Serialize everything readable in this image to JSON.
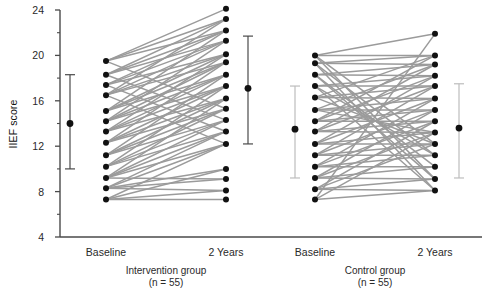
{
  "chart_data": {
    "type": "line",
    "title": "",
    "subtitle": "",
    "xlabel": "",
    "ylabel": "IIEF score",
    "ylim": [
      4,
      24
    ],
    "yticks": [
      4,
      8,
      12,
      16,
      20,
      24
    ],
    "ytick_labels": [
      "4",
      "8",
      "12",
      "16",
      "20",
      "24"
    ],
    "yminor_ticks": [
      6,
      10,
      14,
      18,
      22
    ],
    "grid": false,
    "legend": "none",
    "x_categories": [
      "Baseline",
      "2 Years",
      "Baseline",
      "2 Years"
    ],
    "groups": [
      {
        "name": "Intervention group",
        "n_label": "(n = 55)",
        "n": 55,
        "x_positions": [
          "Baseline",
          "2 Years"
        ],
        "error_bar_color": "#4a4a4a",
        "summary": [
          {
            "x": "Baseline",
            "mean": 14.0,
            "low": 10.0,
            "high": 18.3
          },
          {
            "x": "2 Years",
            "mean": 17.1,
            "low": 12.2,
            "high": 21.7
          }
        ],
        "pairs": [
          {
            "baseline": 19.5,
            "years2": 24.1
          },
          {
            "baseline": 19.5,
            "years2": 23.2
          },
          {
            "baseline": 18.3,
            "years2": 23.2
          },
          {
            "baseline": 18.3,
            "years2": 22.2
          },
          {
            "baseline": 17.4,
            "years2": 22.2
          },
          {
            "baseline": 17.4,
            "years2": 21.3
          },
          {
            "baseline": 16.5,
            "years2": 21.3
          },
          {
            "baseline": 16.5,
            "years2": 20.1
          },
          {
            "baseline": 15.1,
            "years2": 20.1
          },
          {
            "baseline": 15.1,
            "years2": 19.4
          },
          {
            "baseline": 14.2,
            "years2": 19.4
          },
          {
            "baseline": 14.2,
            "years2": 18.3
          },
          {
            "baseline": 13.3,
            "years2": 18.3
          },
          {
            "baseline": 13.3,
            "years2": 17.3
          },
          {
            "baseline": 12.3,
            "years2": 17.3
          },
          {
            "baseline": 12.3,
            "years2": 16.2
          },
          {
            "baseline": 11.2,
            "years2": 16.2
          },
          {
            "baseline": 11.2,
            "years2": 15.3
          },
          {
            "baseline": 10.2,
            "years2": 15.3
          },
          {
            "baseline": 10.2,
            "years2": 14.3
          },
          {
            "baseline": 9.2,
            "years2": 14.3
          },
          {
            "baseline": 9.2,
            "years2": 13.3
          },
          {
            "baseline": 8.3,
            "years2": 13.3
          },
          {
            "baseline": 8.3,
            "years2": 12.2
          },
          {
            "baseline": 7.3,
            "years2": 12.2
          },
          {
            "baseline": 19.5,
            "years2": 22.2
          },
          {
            "baseline": 18.3,
            "years2": 21.3
          },
          {
            "baseline": 17.4,
            "years2": 20.1
          },
          {
            "baseline": 16.5,
            "years2": 19.4
          },
          {
            "baseline": 15.1,
            "years2": 18.3
          },
          {
            "baseline": 14.2,
            "years2": 17.3
          },
          {
            "baseline": 13.3,
            "years2": 16.2
          },
          {
            "baseline": 12.3,
            "years2": 15.3
          },
          {
            "baseline": 11.2,
            "years2": 14.3
          },
          {
            "baseline": 10.2,
            "years2": 13.3
          },
          {
            "baseline": 9.2,
            "years2": 12.2
          },
          {
            "baseline": 8.3,
            "years2": 10.0
          },
          {
            "baseline": 7.3,
            "years2": 10.0
          },
          {
            "baseline": 8.3,
            "years2": 9.1
          },
          {
            "baseline": 9.2,
            "years2": 9.1
          },
          {
            "baseline": 7.3,
            "years2": 8.1
          },
          {
            "baseline": 8.3,
            "years2": 8.1
          },
          {
            "baseline": 7.3,
            "years2": 7.3
          },
          {
            "baseline": 16.5,
            "years2": 23.2
          },
          {
            "baseline": 15.1,
            "years2": 22.2
          },
          {
            "baseline": 14.2,
            "years2": 21.3
          },
          {
            "baseline": 13.3,
            "years2": 20.1
          },
          {
            "baseline": 12.3,
            "years2": 19.4
          },
          {
            "baseline": 11.2,
            "years2": 18.3
          },
          {
            "baseline": 10.2,
            "years2": 17.3
          },
          {
            "baseline": 9.2,
            "years2": 16.2
          },
          {
            "baseline": 19.5,
            "years2": 15.3
          },
          {
            "baseline": 18.3,
            "years2": 14.3
          },
          {
            "baseline": 17.4,
            "years2": 13.3
          },
          {
            "baseline": 16.5,
            "years2": 12.2
          }
        ]
      },
      {
        "name": "Control group",
        "n_label": "(n = 55)",
        "n": 55,
        "x_positions": [
          "Baseline",
          "2 Years"
        ],
        "error_bar_color": "#bdbdbd",
        "summary": [
          {
            "x": "Baseline",
            "mean": 13.5,
            "low": 9.2,
            "high": 17.3
          },
          {
            "x": "2 Years",
            "mean": 13.6,
            "low": 9.2,
            "high": 17.5
          }
        ],
        "pairs": [
          {
            "baseline": 20.0,
            "years2": 21.9
          },
          {
            "baseline": 20.0,
            "years2": 20.0
          },
          {
            "baseline": 19.3,
            "years2": 20.0
          },
          {
            "baseline": 19.3,
            "years2": 19.2
          },
          {
            "baseline": 18.3,
            "years2": 19.2
          },
          {
            "baseline": 18.3,
            "years2": 18.2
          },
          {
            "baseline": 17.3,
            "years2": 18.2
          },
          {
            "baseline": 17.3,
            "years2": 17.3
          },
          {
            "baseline": 16.3,
            "years2": 17.3
          },
          {
            "baseline": 16.3,
            "years2": 16.2
          },
          {
            "baseline": 15.2,
            "years2": 16.2
          },
          {
            "baseline": 15.2,
            "years2": 15.2
          },
          {
            "baseline": 14.2,
            "years2": 15.2
          },
          {
            "baseline": 14.2,
            "years2": 14.2
          },
          {
            "baseline": 13.3,
            "years2": 14.2
          },
          {
            "baseline": 13.3,
            "years2": 13.2
          },
          {
            "baseline": 12.2,
            "years2": 13.2
          },
          {
            "baseline": 12.2,
            "years2": 12.2
          },
          {
            "baseline": 11.2,
            "years2": 12.2
          },
          {
            "baseline": 11.2,
            "years2": 11.2
          },
          {
            "baseline": 10.2,
            "years2": 11.2
          },
          {
            "baseline": 10.2,
            "years2": 10.2
          },
          {
            "baseline": 9.2,
            "years2": 10.2
          },
          {
            "baseline": 9.2,
            "years2": 9.1
          },
          {
            "baseline": 8.2,
            "years2": 9.1
          },
          {
            "baseline": 8.2,
            "years2": 8.1
          },
          {
            "baseline": 7.3,
            "years2": 8.1
          },
          {
            "baseline": 7.3,
            "years2": 21.9
          },
          {
            "baseline": 20.0,
            "years2": 9.1
          },
          {
            "baseline": 19.3,
            "years2": 8.1
          },
          {
            "baseline": 18.3,
            "years2": 10.2
          },
          {
            "baseline": 17.3,
            "years2": 11.2
          },
          {
            "baseline": 16.3,
            "years2": 12.2
          },
          {
            "baseline": 15.2,
            "years2": 13.2
          },
          {
            "baseline": 14.2,
            "years2": 20.0
          },
          {
            "baseline": 13.3,
            "years2": 19.2
          },
          {
            "baseline": 12.2,
            "years2": 18.2
          },
          {
            "baseline": 11.2,
            "years2": 17.3
          },
          {
            "baseline": 10.2,
            "years2": 16.2
          },
          {
            "baseline": 9.2,
            "years2": 15.2
          },
          {
            "baseline": 8.2,
            "years2": 14.2
          },
          {
            "baseline": 7.3,
            "years2": 13.2
          },
          {
            "baseline": 20.0,
            "years2": 12.2
          },
          {
            "baseline": 19.3,
            "years2": 11.2
          },
          {
            "baseline": 18.3,
            "years2": 9.1
          },
          {
            "baseline": 17.3,
            "years2": 8.1
          },
          {
            "baseline": 16.3,
            "years2": 20.0
          },
          {
            "baseline": 15.2,
            "years2": 19.2
          },
          {
            "baseline": 14.2,
            "years2": 18.2
          },
          {
            "baseline": 13.3,
            "years2": 17.3
          },
          {
            "baseline": 12.2,
            "years2": 16.2
          },
          {
            "baseline": 11.2,
            "years2": 15.2
          },
          {
            "baseline": 10.2,
            "years2": 14.2
          },
          {
            "baseline": 9.2,
            "years2": 13.2
          },
          {
            "baseline": 8.2,
            "years2": 12.2
          }
        ]
      }
    ],
    "colors": {
      "point": "#111111",
      "line": "#9b9b9b",
      "axis": "#4a4a4a",
      "text": "#2a2a2a",
      "errorbar_intervention": "#4a4a4a",
      "errorbar_control": "#bdbdbd"
    }
  },
  "axis": {
    "y_title": "IIEF score",
    "tick_labels": [
      "24",
      "20",
      "16",
      "12",
      "8",
      "4"
    ]
  },
  "categories": {
    "intervention_baseline": "Baseline",
    "intervention_2years": "2 Years",
    "control_baseline": "Baseline",
    "control_2years": "2 Years"
  },
  "group_captions": {
    "intervention_name": "Intervention group",
    "intervention_n": "(n = 55)",
    "control_name": "Control group",
    "control_n": "(n = 55)"
  }
}
